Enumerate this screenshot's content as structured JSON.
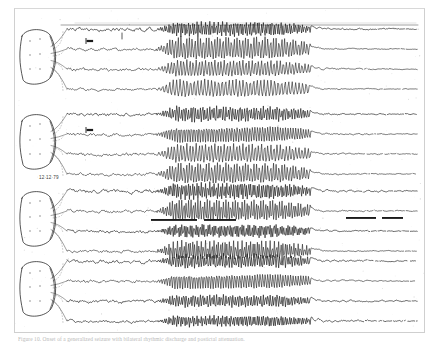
{
  "figure": {
    "kind": "eeg-polygraph-chart-recording",
    "media": "scanned photographic plate",
    "frame_color": "#cfcfcf",
    "background_color": "#ffffff",
    "ink_color": "#1a1a1a",
    "caption": "Figure 10. Onset of a generalized seizure with bilateral rhythmic discharge and postictal attenuation.",
    "date_stamp": "12·12·79",
    "channel_count": 16,
    "group_count": 4,
    "channels_per_group": 4,
    "time_axis_note": "left to right",
    "onset_x_fraction": 0.27,
    "offset_x_fraction": 0.7
  },
  "montage": {
    "label": "head-schematic",
    "diagram_count": 4,
    "diagrams": [
      {
        "name": "head-diagram-1",
        "group": 1,
        "electrode_dots": 6
      },
      {
        "name": "head-diagram-2",
        "group": 2,
        "electrode_dots": 6
      },
      {
        "name": "head-diagram-3",
        "group": 3,
        "electrode_dots": 6
      },
      {
        "name": "head-diagram-4",
        "group": 4,
        "electrode_dots": 6
      }
    ]
  },
  "markers": {
    "calibration_bars": [
      {
        "name": "calibration-marker-top",
        "x": 86,
        "y": 41
      },
      {
        "name": "calibration-marker-mid",
        "x": 86,
        "y": 130
      }
    ],
    "timing_bars": [
      {
        "name": "event-bar-left",
        "x": 151,
        "y": 219,
        "width": 46
      },
      {
        "name": "event-bar-right",
        "x": 204,
        "y": 219,
        "width": 32
      },
      {
        "name": "event-bar-far-right",
        "x": 346,
        "y": 217,
        "width": 30
      },
      {
        "name": "event-bar-far-right-2",
        "x": 382,
        "y": 217,
        "width": 21
      }
    ],
    "onset_tick": {
      "name": "seizure-onset-tick",
      "x": 122,
      "y": 36
    }
  },
  "chart_data": {
    "type": "line",
    "title": "",
    "xlabel": "",
    "ylabel": "",
    "x": [
      0,
      1
    ],
    "series": [
      {
        "name": "Fp1-F7",
        "group": 1,
        "baseline_amp": 2.2,
        "ictal_amp": 7.0,
        "ictal_freq": 13,
        "post_amp": 1.6,
        "style": "spiky"
      },
      {
        "name": "F7-T3",
        "group": 1,
        "baseline_amp": 1.6,
        "ictal_amp": 11.0,
        "ictal_freq": 10,
        "post_amp": 1.1,
        "style": "sine"
      },
      {
        "name": "T3-T5",
        "group": 1,
        "baseline_amp": 1.8,
        "ictal_amp": 8.0,
        "ictal_freq": 9,
        "post_amp": 1.3,
        "style": "sine"
      },
      {
        "name": "T5-O1",
        "group": 1,
        "baseline_amp": 1.4,
        "ictal_amp": 8.5,
        "ictal_freq": 8,
        "post_amp": 1.0,
        "style": "sine"
      },
      {
        "name": "Fp2-F8",
        "group": 2,
        "baseline_amp": 2.0,
        "ictal_amp": 7.5,
        "ictal_freq": 12,
        "post_amp": 1.5,
        "style": "spiky"
      },
      {
        "name": "F8-T4",
        "group": 2,
        "baseline_amp": 1.7,
        "ictal_amp": 9.5,
        "ictal_freq": 11,
        "post_amp": 1.2,
        "style": "sine"
      },
      {
        "name": "T4-T6",
        "group": 2,
        "baseline_amp": 1.9,
        "ictal_amp": 9.0,
        "ictal_freq": 9,
        "post_amp": 1.4,
        "style": "sine"
      },
      {
        "name": "T6-O2",
        "group": 2,
        "baseline_amp": 1.5,
        "ictal_amp": 10.0,
        "ictal_freq": 10,
        "post_amp": 1.1,
        "style": "sine"
      },
      {
        "name": "Fp1-F3",
        "group": 3,
        "baseline_amp": 2.1,
        "ictal_amp": 8.0,
        "ictal_freq": 13,
        "post_amp": 1.7,
        "style": "spiky"
      },
      {
        "name": "F3-C3",
        "group": 3,
        "baseline_amp": 1.6,
        "ictal_amp": 10.5,
        "ictal_freq": 12,
        "post_amp": 1.2,
        "style": "sine"
      },
      {
        "name": "C3-P3",
        "group": 3,
        "baseline_amp": 1.8,
        "ictal_amp": 6.5,
        "ictal_freq": 14,
        "post_amp": 1.3,
        "style": "spiky"
      },
      {
        "name": "P3-O1",
        "group": 3,
        "baseline_amp": 1.5,
        "ictal_amp": 9.5,
        "ictal_freq": 13,
        "post_amp": 1.1,
        "style": "sine"
      },
      {
        "name": "Fp2-F4",
        "group": 4,
        "baseline_amp": 2.0,
        "ictal_amp": 7.0,
        "ictal_freq": 12,
        "post_amp": 1.6,
        "style": "spiky"
      },
      {
        "name": "F4-C4",
        "group": 4,
        "baseline_amp": 1.7,
        "ictal_amp": 9.0,
        "ictal_freq": 11,
        "post_amp": 1.3,
        "style": "sine"
      },
      {
        "name": "C4-P4",
        "group": 4,
        "baseline_amp": 1.9,
        "ictal_amp": 6.0,
        "ictal_freq": 12,
        "post_amp": 1.5,
        "style": "spiky"
      },
      {
        "name": "P4-O2",
        "group": 4,
        "baseline_amp": 1.6,
        "ictal_amp": 5.5,
        "ictal_freq": 13,
        "post_amp": 1.9,
        "style": "spiky"
      }
    ],
    "legend_position": "none",
    "grid": false
  }
}
